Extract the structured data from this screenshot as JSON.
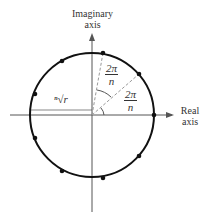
{
  "axes": {
    "imaginary_label_line1": "Imaginary",
    "imaginary_label_line2": "axis",
    "real_label_line1": "Real",
    "real_label_line2": "axis"
  },
  "annotations": {
    "radius_label": "ⁿ√r",
    "angle1_num": "2π",
    "angle1_den": "n",
    "angle2_num": "2π",
    "angle2_den": "n"
  },
  "colors": {
    "circle": "#111111",
    "axis": "#555555",
    "dashed": "#999999"
  }
}
